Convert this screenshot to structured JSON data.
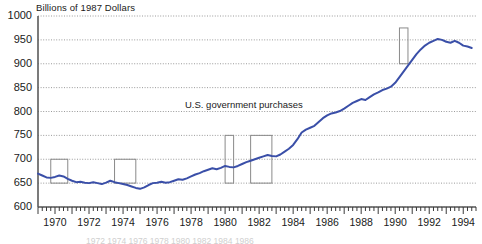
{
  "chart_data": {
    "type": "line",
    "title": "",
    "ylabel": "Billions of 1987 Dollars",
    "xlabel": "",
    "series_label": "U.S. government purchases",
    "line_color": "#3a4fa8",
    "grid": true,
    "grid_style": "dotted",
    "legend_position": "inline-annotation",
    "xlim": [
      1969.0,
      1994.75
    ],
    "ylim": [
      600,
      1000
    ],
    "ytick_labels": [
      "1000",
      "950",
      "900",
      "850",
      "800",
      "750",
      "700",
      "650",
      "600"
    ],
    "yticks": [
      1000,
      950,
      900,
      850,
      800,
      750,
      700,
      650,
      600
    ],
    "xtick_labels": [
      "1970",
      "1972",
      "1974",
      "1976",
      "1978",
      "1980",
      "1982",
      "1984",
      "1986",
      "1988",
      "1990",
      "1992",
      "1994"
    ],
    "xticks": [
      1970,
      1972,
      1974,
      1976,
      1978,
      1980,
      1982,
      1984,
      1986,
      1988,
      1990,
      1992,
      1994
    ],
    "minor_tick_interval": 0.25,
    "x": [
      1969.0,
      1969.25,
      1969.5,
      1969.75,
      1970.0,
      1970.25,
      1970.5,
      1970.75,
      1971.0,
      1971.25,
      1971.5,
      1971.75,
      1972.0,
      1972.25,
      1972.5,
      1972.75,
      1973.0,
      1973.25,
      1973.5,
      1973.75,
      1974.0,
      1974.25,
      1974.5,
      1974.75,
      1975.0,
      1975.25,
      1975.5,
      1975.75,
      1976.0,
      1976.25,
      1976.5,
      1976.75,
      1977.0,
      1977.25,
      1977.5,
      1977.75,
      1978.0,
      1978.25,
      1978.5,
      1978.75,
      1979.0,
      1979.25,
      1979.5,
      1979.75,
      1980.0,
      1980.25,
      1980.5,
      1980.75,
      1981.0,
      1981.25,
      1981.5,
      1981.75,
      1982.0,
      1982.25,
      1982.5,
      1982.75,
      1983.0,
      1983.25,
      1983.5,
      1983.75,
      1984.0,
      1984.25,
      1984.5,
      1984.75,
      1985.0,
      1985.25,
      1985.5,
      1985.75,
      1986.0,
      1986.25,
      1986.5,
      1986.75,
      1987.0,
      1987.25,
      1987.5,
      1987.75,
      1988.0,
      1988.25,
      1988.5,
      1988.75,
      1989.0,
      1989.25,
      1989.5,
      1989.75,
      1990.0,
      1990.25,
      1990.5,
      1990.75,
      1991.0,
      1991.25,
      1991.5,
      1991.75,
      1992.0,
      1992.25,
      1992.5,
      1992.75,
      1993.0,
      1993.25,
      1993.5,
      1993.75,
      1994.0,
      1994.25,
      1994.5
    ],
    "y": [
      670,
      666,
      662,
      661,
      663,
      666,
      664,
      659,
      655,
      652,
      653,
      651,
      650,
      652,
      650,
      648,
      651,
      655,
      652,
      650,
      648,
      646,
      643,
      640,
      638,
      641,
      646,
      650,
      651,
      653,
      651,
      652,
      655,
      658,
      657,
      660,
      664,
      668,
      671,
      675,
      678,
      681,
      679,
      682,
      686,
      684,
      683,
      686,
      690,
      694,
      697,
      700,
      703,
      706,
      709,
      707,
      706,
      710,
      716,
      722,
      730,
      742,
      756,
      762,
      766,
      770,
      778,
      786,
      792,
      796,
      798,
      801,
      806,
      812,
      818,
      822,
      826,
      824,
      830,
      836,
      840,
      845,
      848,
      852,
      860,
      872,
      884,
      896,
      908,
      920,
      930,
      938,
      944,
      948,
      952,
      950,
      946,
      944,
      948,
      944,
      938,
      936,
      933,
      929,
      931
    ],
    "recession_boxes": [
      {
        "x0": 1969.75,
        "x1": 1970.75,
        "y0": 650,
        "y1": 700
      },
      {
        "x0": 1973.5,
        "x1": 1974.75,
        "y0": 650,
        "y1": 700
      },
      {
        "x0": 1980.0,
        "x1": 1980.5,
        "y0": 650,
        "y1": 750
      },
      {
        "x0": 1981.5,
        "x1": 1982.75,
        "y0": 650,
        "y1": 750
      },
      {
        "x0": 1990.25,
        "x1": 1990.75,
        "y0": 900,
        "y1": 975
      }
    ],
    "bleed_text": "1972    1974    1976    1978    1980    1982    1984    1986"
  }
}
